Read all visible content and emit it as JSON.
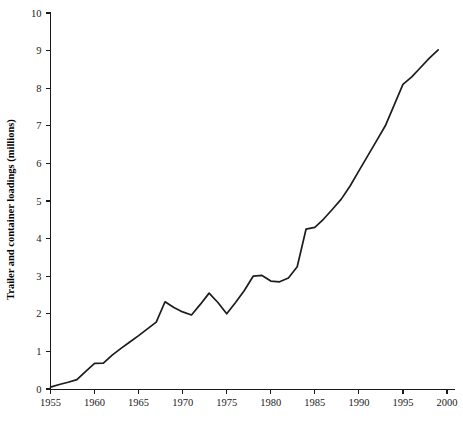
{
  "chart_data": {
    "type": "line",
    "title": "",
    "subtitle": "",
    "xlabel": "",
    "ylabel": "Trailer and container loadings (millions)",
    "xlim": [
      1955,
      2000
    ],
    "ylim": [
      0,
      10
    ],
    "grid": false,
    "legend": null,
    "legend_position": "none",
    "x_ticks": [
      1955,
      1960,
      1965,
      1970,
      1975,
      1980,
      1985,
      1990,
      1995,
      2000
    ],
    "x_tick_labels": [
      "1955",
      "1960",
      "1965",
      "1970",
      "1975",
      "1980",
      "1985",
      "1990",
      "1995",
      "2000"
    ],
    "y_ticks": [
      0,
      1,
      2,
      3,
      4,
      5,
      6,
      7,
      8,
      9,
      10
    ],
    "y_tick_labels": [
      "0",
      "1",
      "2",
      "3",
      "4",
      "5",
      "6",
      "7",
      "8",
      "9",
      "10"
    ],
    "line_color": "#1c1c1c",
    "series": [
      {
        "name": "Trailer and container loadings",
        "x": [
          1955,
          1956,
          1957,
          1958,
          1959,
          1960,
          1961,
          1962,
          1963,
          1964,
          1965,
          1966,
          1967,
          1968,
          1969,
          1970,
          1971,
          1972,
          1973,
          1974,
          1975,
          1976,
          1977,
          1978,
          1979,
          1980,
          1981,
          1982,
          1983,
          1984,
          1985,
          1986,
          1987,
          1988,
          1989,
          1990,
          1991,
          1992,
          1993,
          1994,
          1995,
          1996,
          1997,
          1998,
          1999
        ],
        "values": [
          0.05,
          0.12,
          0.18,
          0.25,
          0.47,
          0.68,
          0.69,
          0.9,
          1.08,
          1.25,
          1.42,
          1.6,
          1.78,
          2.32,
          2.17,
          2.05,
          1.97,
          2.25,
          2.55,
          2.3,
          2.0,
          2.3,
          2.62,
          3.0,
          3.02,
          2.87,
          2.85,
          2.95,
          3.25,
          4.25,
          4.3,
          4.52,
          4.78,
          5.05,
          5.4,
          5.8,
          6.2,
          6.6,
          7.0,
          7.55,
          8.1,
          8.3,
          8.55,
          8.8,
          9.02
        ]
      }
    ]
  },
  "axis": {
    "y_title": "Trailer and container loadings (millions)"
  }
}
